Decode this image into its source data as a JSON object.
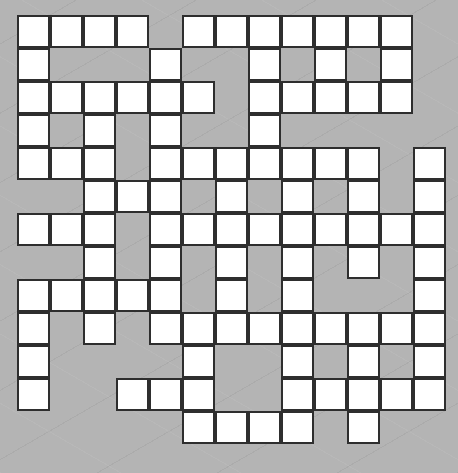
{
  "puzzle": {
    "type": "crossword-grid",
    "rows": 13,
    "cols": 13,
    "cell_size_px": 33,
    "colors": {
      "background": "#b4b4b4",
      "cell": "#ffffff",
      "border": "#2e2e2e"
    },
    "grid": [
      "1111011111110",
      "1000100101010",
      "1111110111110",
      "1010100100000",
      "1110111111101",
      "0011101010101",
      "1110111111111",
      "0010101010101",
      "1111101010001",
      "1010111111111",
      "1000010010101",
      "1001110011111",
      "0000011110100"
    ]
  }
}
